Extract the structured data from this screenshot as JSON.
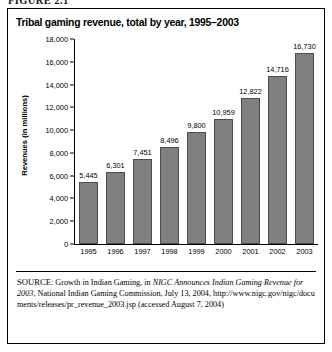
{
  "figure": {
    "label": "FIGURE 2.1"
  },
  "chart_data": {
    "type": "bar",
    "title": "Tribal gaming revenue, total by year, 1995–2003",
    "xlabel": "",
    "ylabel": "Revenues (in millions)",
    "categories": [
      "1995",
      "1996",
      "1997",
      "1998",
      "1999",
      "2000",
      "2001",
      "2002",
      "2003"
    ],
    "values": [
      5445,
      6301,
      7451,
      8496,
      9800,
      10959,
      12822,
      14716,
      16730
    ],
    "value_labels": [
      "5,445",
      "6,301",
      "7,451",
      "8,496",
      "9,800",
      "10,959",
      "12,822",
      "14,716",
      "16,730"
    ],
    "ylim": [
      0,
      18000
    ],
    "yticks": [
      0,
      2000,
      4000,
      6000,
      8000,
      10000,
      12000,
      14000,
      16000,
      18000
    ],
    "ytick_labels": [
      "0",
      "2,000",
      "4,000",
      "6,000",
      "8,000",
      "10,000",
      "12,000",
      "14,000",
      "16,000",
      "18,000"
    ],
    "grid": false,
    "legend": "none",
    "bar_color": "#808080",
    "bar_border_color": "#4d4d4d"
  },
  "source": {
    "label": "SOURCE:",
    "text_part1": " Growth in Indian Gaming, in ",
    "italic1": "NIGC Announces Indian Gaming Revenue for 2003",
    "text_part2": ", National Indian Gaming Commission, July 13, 2004, ",
    "url": "http://www.nigc.gov/nigc/documents/releases/pr_revenue_2003.jsp",
    "accessed": " (accessed August 7, 2004)"
  }
}
